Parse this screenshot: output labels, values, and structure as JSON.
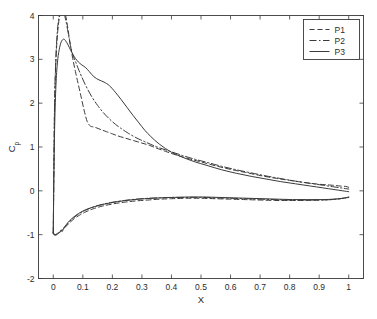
{
  "chart_data": {
    "type": "line",
    "title": "",
    "xlabel": "X",
    "ylabel": "Cp",
    "ylabel_base": "C",
    "ylabel_sub": "p",
    "xlim": [
      -0.05,
      1.05
    ],
    "ylim": [
      -2,
      4
    ],
    "xticks": [
      0,
      0.1,
      0.2,
      0.3,
      0.4,
      0.5,
      0.6,
      0.7,
      0.8,
      0.9,
      1
    ],
    "xticklabels": [
      "0",
      "0.1",
      "0.2",
      "0.3",
      "0.4",
      "0.5",
      "0.6",
      "0.7",
      "0.8",
      "0.9",
      "1"
    ],
    "yticks": [
      -2,
      -1,
      0,
      1,
      2,
      3,
      4
    ],
    "yticklabels": [
      "-2",
      "-1",
      "0",
      "1",
      "2",
      "3",
      "4"
    ],
    "grid": false,
    "legend_position": "top-right",
    "legend_entries": [
      "P1",
      "P2",
      "P3"
    ],
    "line_color": "#3a3a3a",
    "background_color": "#ffffff",
    "series": [
      {
        "name": "P1",
        "dash": "dashed",
        "dasharray": "5,3",
        "width": 1.0,
        "upper": {
          "x": [
            0.0,
            0.002,
            0.004,
            0.007,
            0.011,
            0.016,
            0.022,
            0.03,
            0.038,
            0.046,
            0.055,
            0.065,
            0.075,
            0.085,
            0.095,
            0.105,
            0.115,
            0.125,
            0.135,
            0.145,
            0.16,
            0.18,
            0.2,
            0.22,
            0.24,
            0.26,
            0.28,
            0.3,
            0.32,
            0.34,
            0.38,
            0.42,
            0.46,
            0.5,
            0.55,
            0.6,
            0.65,
            0.7,
            0.75,
            0.8,
            0.85,
            0.9,
            0.94,
            0.97,
            0.99,
            1.0
          ],
          "y": [
            -0.95,
            0.4,
            1.7,
            2.6,
            3.25,
            3.7,
            4.0,
            4.15,
            4.1,
            3.85,
            3.45,
            3.05,
            2.72,
            2.42,
            2.12,
            1.82,
            1.58,
            1.48,
            1.46,
            1.44,
            1.4,
            1.35,
            1.3,
            1.25,
            1.21,
            1.17,
            1.13,
            1.09,
            1.05,
            1.0,
            0.9,
            0.81,
            0.73,
            0.66,
            0.57,
            0.49,
            0.42,
            0.35,
            0.29,
            0.24,
            0.19,
            0.15,
            0.13,
            0.11,
            0.1,
            0.08
          ]
        },
        "lower": {
          "x": [
            0.0,
            0.003,
            0.007,
            0.012,
            0.018,
            0.025,
            0.033,
            0.042,
            0.055,
            0.07,
            0.09,
            0.11,
            0.135,
            0.165,
            0.2,
            0.24,
            0.28,
            0.32,
            0.36,
            0.4,
            0.45,
            0.5,
            0.55,
            0.6,
            0.65,
            0.7,
            0.75,
            0.8,
            0.85,
            0.9,
            0.94,
            0.97,
            1.0
          ],
          "y": [
            -0.95,
            -1.0,
            -1.01,
            -1.0,
            -0.97,
            -0.93,
            -0.88,
            -0.82,
            -0.73,
            -0.64,
            -0.55,
            -0.48,
            -0.41,
            -0.35,
            -0.3,
            -0.26,
            -0.23,
            -0.21,
            -0.19,
            -0.18,
            -0.17,
            -0.17,
            -0.18,
            -0.19,
            -0.2,
            -0.21,
            -0.22,
            -0.22,
            -0.22,
            -0.21,
            -0.2,
            -0.18,
            -0.15
          ]
        }
      },
      {
        "name": "P2",
        "dash": "dashdot",
        "dasharray": "7,2.5,1.5,2.5",
        "width": 1.0,
        "upper": {
          "x": [
            0.0,
            0.002,
            0.004,
            0.007,
            0.011,
            0.016,
            0.022,
            0.028,
            0.035,
            0.042,
            0.05,
            0.058,
            0.066,
            0.075,
            0.085,
            0.095,
            0.11,
            0.13,
            0.15,
            0.17,
            0.19,
            0.21,
            0.23,
            0.25,
            0.27,
            0.29,
            0.31,
            0.33,
            0.36,
            0.4,
            0.44,
            0.48,
            0.52,
            0.57,
            0.62,
            0.67,
            0.72,
            0.77,
            0.82,
            0.87,
            0.91,
            0.95,
            0.98,
            1.0
          ],
          "y": [
            -0.95,
            0.45,
            1.8,
            2.7,
            3.35,
            3.8,
            4.05,
            4.15,
            4.08,
            3.9,
            3.62,
            3.32,
            3.1,
            2.95,
            2.78,
            2.62,
            2.4,
            2.15,
            1.95,
            1.78,
            1.64,
            1.52,
            1.42,
            1.33,
            1.25,
            1.18,
            1.12,
            1.06,
            0.98,
            0.89,
            0.8,
            0.72,
            0.65,
            0.56,
            0.48,
            0.41,
            0.34,
            0.28,
            0.22,
            0.17,
            0.13,
            0.09,
            0.06,
            0.04
          ]
        },
        "lower": {
          "x": [
            0.0,
            0.003,
            0.007,
            0.012,
            0.018,
            0.025,
            0.033,
            0.042,
            0.055,
            0.07,
            0.09,
            0.11,
            0.135,
            0.165,
            0.2,
            0.24,
            0.28,
            0.32,
            0.36,
            0.4,
            0.45,
            0.5,
            0.55,
            0.6,
            0.65,
            0.7,
            0.75,
            0.8,
            0.85,
            0.9,
            0.94,
            0.97,
            1.0
          ],
          "y": [
            -0.95,
            -0.99,
            -1.0,
            -0.98,
            -0.95,
            -0.91,
            -0.86,
            -0.8,
            -0.7,
            -0.61,
            -0.51,
            -0.44,
            -0.37,
            -0.31,
            -0.26,
            -0.22,
            -0.19,
            -0.17,
            -0.16,
            -0.15,
            -0.15,
            -0.15,
            -0.16,
            -0.17,
            -0.18,
            -0.19,
            -0.2,
            -0.21,
            -0.21,
            -0.21,
            -0.2,
            -0.18,
            -0.15
          ]
        }
      },
      {
        "name": "P3",
        "dash": "solid",
        "dasharray": "none",
        "width": 1.0,
        "upper": {
          "x": [
            0.0,
            0.002,
            0.005,
            0.009,
            0.014,
            0.02,
            0.027,
            0.035,
            0.042,
            0.05,
            0.058,
            0.066,
            0.075,
            0.085,
            0.095,
            0.108,
            0.122,
            0.138,
            0.155,
            0.172,
            0.19,
            0.21,
            0.23,
            0.25,
            0.27,
            0.29,
            0.31,
            0.33,
            0.36,
            0.4,
            0.44,
            0.48,
            0.52,
            0.57,
            0.62,
            0.67,
            0.72,
            0.77,
            0.82,
            0.87,
            0.91,
            0.95,
            0.98,
            1.0
          ],
          "y": [
            -0.98,
            0.35,
            1.55,
            2.4,
            2.92,
            3.22,
            3.4,
            3.46,
            3.42,
            3.33,
            3.22,
            3.12,
            3.02,
            2.94,
            2.88,
            2.82,
            2.72,
            2.6,
            2.53,
            2.48,
            2.4,
            2.25,
            2.08,
            1.9,
            1.72,
            1.55,
            1.38,
            1.24,
            1.06,
            0.88,
            0.76,
            0.66,
            0.58,
            0.48,
            0.4,
            0.33,
            0.27,
            0.21,
            0.16,
            0.11,
            0.07,
            0.03,
            0.0,
            -0.02
          ]
        },
        "lower": {
          "x": [
            0.0,
            0.003,
            0.008,
            0.014,
            0.02,
            0.026,
            0.03,
            0.034,
            0.04,
            0.05,
            0.065,
            0.085,
            0.11,
            0.14,
            0.175,
            0.215,
            0.26,
            0.31,
            0.36,
            0.41,
            0.46,
            0.51,
            0.56,
            0.61,
            0.66,
            0.71,
            0.76,
            0.81,
            0.86,
            0.91,
            0.95,
            0.98,
            1.0
          ],
          "y": [
            -0.98,
            -1.0,
            -1.0,
            -0.99,
            -0.96,
            -0.9,
            -0.93,
            -0.88,
            -0.81,
            -0.72,
            -0.62,
            -0.52,
            -0.43,
            -0.36,
            -0.3,
            -0.25,
            -0.21,
            -0.18,
            -0.16,
            -0.15,
            -0.14,
            -0.14,
            -0.15,
            -0.16,
            -0.17,
            -0.18,
            -0.19,
            -0.2,
            -0.2,
            -0.2,
            -0.19,
            -0.17,
            -0.14
          ]
        }
      }
    ]
  }
}
